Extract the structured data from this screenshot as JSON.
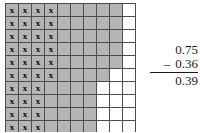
{
  "figure": {
    "name": "decimal-subtraction-grid-model",
    "description_type": "hundredths-grid"
  },
  "grid": {
    "rows": 10,
    "columns": 10,
    "total_cells": 100,
    "shaded_count": 75,
    "marked_count": 36,
    "remaining_count": 39,
    "x_glyph": "x",
    "shaded_color": "#b5b5b5",
    "unshaded_color": "#ffffff",
    "border_color": "#4d4d4d",
    "shaded_per_row": [
      9,
      9,
      9,
      9,
      9,
      8,
      7,
      7,
      7,
      7
    ],
    "marked_per_row": [
      4,
      4,
      4,
      4,
      4,
      4,
      3,
      3,
      3,
      3
    ],
    "cells": [
      [
        "marked",
        "marked",
        "marked",
        "marked",
        "shaded",
        "shaded",
        "shaded",
        "shaded",
        "shaded",
        "empty"
      ],
      [
        "marked",
        "marked",
        "marked",
        "marked",
        "shaded",
        "shaded",
        "shaded",
        "shaded",
        "shaded",
        "empty"
      ],
      [
        "marked",
        "marked",
        "marked",
        "marked",
        "shaded",
        "shaded",
        "shaded",
        "shaded",
        "shaded",
        "empty"
      ],
      [
        "marked",
        "marked",
        "marked",
        "marked",
        "shaded",
        "shaded",
        "shaded",
        "shaded",
        "shaded",
        "empty"
      ],
      [
        "marked",
        "marked",
        "marked",
        "marked",
        "shaded",
        "shaded",
        "shaded",
        "shaded",
        "shaded",
        "empty"
      ],
      [
        "marked",
        "marked",
        "marked",
        "marked",
        "shaded",
        "shaded",
        "shaded",
        "shaded",
        "empty",
        "empty"
      ],
      [
        "marked",
        "marked",
        "marked",
        "shaded",
        "shaded",
        "shaded",
        "shaded",
        "empty",
        "empty",
        "empty"
      ],
      [
        "marked",
        "marked",
        "marked",
        "shaded",
        "shaded",
        "shaded",
        "shaded",
        "empty",
        "empty",
        "empty"
      ],
      [
        "marked",
        "marked",
        "marked",
        "shaded",
        "shaded",
        "shaded",
        "shaded",
        "empty",
        "empty",
        "empty"
      ],
      [
        "marked",
        "marked",
        "marked",
        "shaded",
        "shaded",
        "shaded",
        "shaded",
        "empty",
        "empty",
        "empty"
      ]
    ]
  },
  "arithmetic": {
    "minuend": "0.75",
    "operator": "–",
    "subtrahend": "0.36",
    "difference": "0.39"
  }
}
